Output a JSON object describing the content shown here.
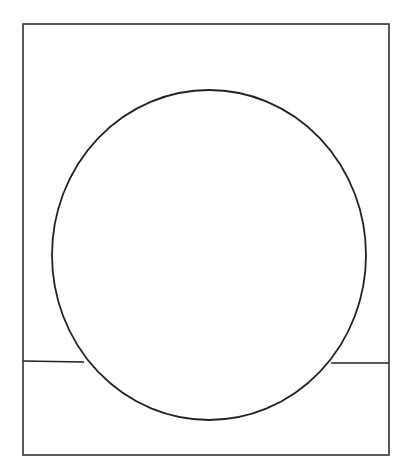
{
  "figure": {
    "frame": {
      "x": 23,
      "y": 24,
      "width": 366,
      "height": 431,
      "stroke": "#333333"
    },
    "circle": {
      "cx": 209,
      "cy": 255,
      "rx": 157,
      "ry": 165,
      "stroke": "#222222"
    },
    "horizon_left": {
      "x1": 23,
      "y1": 361,
      "x2": 84,
      "y2": 362
    },
    "horizon_right": {
      "x1": 331,
      "y1": 363,
      "x2": 389,
      "y2": 363
    }
  }
}
